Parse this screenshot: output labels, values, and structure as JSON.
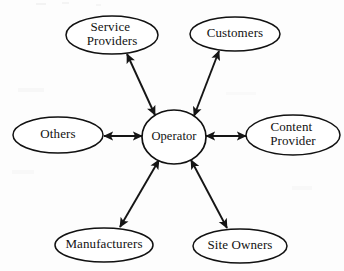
{
  "diagram": {
    "type": "hub-and-spoke",
    "style": {
      "background_color": "#fdfdfd",
      "stroke_color": "#111111",
      "text_color": "#121212",
      "node_fill": "#ffffff"
    },
    "center_node": {
      "id": "operator",
      "label": "Operator",
      "shape": "ellipse",
      "cx": 174,
      "cy": 137,
      "rx": 32,
      "ry": 27
    },
    "satellite_nodes": [
      {
        "id": "service-providers",
        "label": "Service Providers",
        "lines": [
          "Service",
          "Providers"
        ],
        "shape": "ellipse",
        "cx": 112,
        "cy": 35,
        "rx": 46,
        "ry": 19
      },
      {
        "id": "customers",
        "label": "Customers",
        "lines": [
          "Customers"
        ],
        "shape": "ellipse",
        "cx": 235,
        "cy": 34,
        "rx": 45,
        "ry": 17
      },
      {
        "id": "others",
        "label": "Others",
        "lines": [
          "Others"
        ],
        "shape": "ellipse",
        "cx": 58,
        "cy": 135,
        "rx": 45,
        "ry": 18
      },
      {
        "id": "content-provider",
        "label": "Content Provider",
        "lines": [
          "Content",
          "Provider"
        ],
        "shape": "ellipse",
        "cx": 293,
        "cy": 135,
        "rx": 47,
        "ry": 20
      },
      {
        "id": "manufacturers",
        "label": "Manufacturers",
        "lines": [
          "Manufacturers"
        ],
        "shape": "ellipse",
        "cx": 104,
        "cy": 245,
        "rx": 49,
        "ry": 17
      },
      {
        "id": "site-owners",
        "label": "Site Owners",
        "lines": [
          "Site Owners"
        ],
        "shape": "ellipse",
        "cx": 240,
        "cy": 246,
        "rx": 47,
        "ry": 17
      }
    ],
    "edges": [
      {
        "id": "edge-operator-service-providers",
        "from": "operator",
        "to": "service-providers",
        "arrow": "bidirectional",
        "x1": 155,
        "y1": 115,
        "x2": 127,
        "y2": 54
      },
      {
        "id": "edge-operator-customers",
        "from": "operator",
        "to": "customers",
        "arrow": "bidirectional",
        "x1": 194,
        "y1": 116,
        "x2": 219,
        "y2": 51
      },
      {
        "id": "edge-operator-others",
        "from": "operator",
        "to": "others",
        "arrow": "bidirectional",
        "x1": 142,
        "y1": 136,
        "x2": 104,
        "y2": 136
      },
      {
        "id": "edge-operator-content-provider",
        "from": "operator",
        "to": "content-provider",
        "arrow": "bidirectional",
        "x1": 206,
        "y1": 136,
        "x2": 246,
        "y2": 136
      },
      {
        "id": "edge-operator-manufacturers",
        "from": "operator",
        "to": "manufacturers",
        "arrow": "bidirectional",
        "x1": 159,
        "y1": 160,
        "x2": 120,
        "y2": 227
      },
      {
        "id": "edge-operator-site-owners",
        "from": "operator",
        "to": "site-owners",
        "arrow": "bidirectional",
        "x1": 191,
        "y1": 160,
        "x2": 227,
        "y2": 228
      }
    ]
  }
}
